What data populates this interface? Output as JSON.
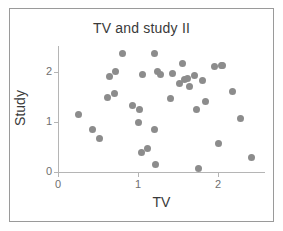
{
  "chart_data": {
    "type": "scatter",
    "title": "TV and study II",
    "xlabel": "TV",
    "ylabel": "Study",
    "xlim": [
      0,
      2.45
    ],
    "ylim": [
      0,
      2.45
    ],
    "grid": false,
    "legend": null,
    "xticks": [
      "0",
      "1",
      "2"
    ],
    "xtick_values": [
      0,
      1,
      2
    ],
    "yticks": [
      "0",
      "1",
      "2"
    ],
    "ytick_values": [
      0,
      1,
      2
    ],
    "marker_color": "#8c8c8c",
    "axis_color": "#b5b5b5",
    "frame_color": "#9a9a9a",
    "text_color": "#3a3a3a",
    "tick_label_color": "#6f6f6f",
    "n_points": 43,
    "x": [
      0.25,
      0.43,
      0.52,
      0.62,
      0.64,
      0.7,
      0.72,
      0.8,
      0.93,
      1.0,
      1.02,
      1.04,
      1.05,
      1.06,
      1.12,
      1.2,
      1.21,
      1.22,
      1.24,
      1.26,
      1.28,
      1.4,
      1.43,
      1.52,
      1.55,
      1.58,
      1.62,
      1.64,
      1.66,
      1.7,
      1.73,
      1.76,
      1.8,
      1.84,
      1.88,
      1.95,
      2.0,
      2.04,
      2.06,
      2.18,
      2.28,
      2.32,
      2.42
    ],
    "y": [
      1.15,
      0.85,
      0.68,
      1.5,
      1.92,
      1.57,
      2.02,
      2.38,
      1.33,
      1.0,
      1.25,
      0.4,
      1.95,
      1.25,
      0.47,
      0.85,
      2.38,
      0.15,
      2.02,
      1.95,
      1.95,
      1.48,
      1.97,
      1.78,
      2.18,
      1.85,
      1.88,
      1.72,
      1.8,
      1.93,
      1.25,
      0.08,
      1.83,
      1.42,
      1.95,
      2.12,
      0.58,
      2.13,
      2.13,
      1.62,
      1.08,
      1.08,
      0.3
    ],
    "points": [
      {
        "x": 0.25,
        "y": 1.15
      },
      {
        "x": 0.43,
        "y": 0.85
      },
      {
        "x": 0.52,
        "y": 0.68
      },
      {
        "x": 0.62,
        "y": 1.5
      },
      {
        "x": 0.64,
        "y": 1.92
      },
      {
        "x": 0.7,
        "y": 1.57
      },
      {
        "x": 0.72,
        "y": 2.02
      },
      {
        "x": 0.8,
        "y": 2.38
      },
      {
        "x": 0.93,
        "y": 1.33
      },
      {
        "x": 1.0,
        "y": 1.0
      },
      {
        "x": 1.02,
        "y": 1.25
      },
      {
        "x": 1.04,
        "y": 0.4
      },
      {
        "x": 1.05,
        "y": 1.95
      },
      {
        "x": 1.12,
        "y": 0.47
      },
      {
        "x": 1.2,
        "y": 0.85
      },
      {
        "x": 1.21,
        "y": 2.38
      },
      {
        "x": 1.22,
        "y": 0.15
      },
      {
        "x": 1.24,
        "y": 2.02
      },
      {
        "x": 1.28,
        "y": 1.95
      },
      {
        "x": 1.4,
        "y": 1.48
      },
      {
        "x": 1.43,
        "y": 1.97
      },
      {
        "x": 1.52,
        "y": 1.78
      },
      {
        "x": 1.55,
        "y": 2.18
      },
      {
        "x": 1.58,
        "y": 1.85
      },
      {
        "x": 1.62,
        "y": 1.88
      },
      {
        "x": 1.64,
        "y": 1.72
      },
      {
        "x": 1.7,
        "y": 1.93
      },
      {
        "x": 1.73,
        "y": 1.25
      },
      {
        "x": 1.76,
        "y": 0.08
      },
      {
        "x": 1.8,
        "y": 1.83
      },
      {
        "x": 1.84,
        "y": 1.42
      },
      {
        "x": 1.95,
        "y": 2.12
      },
      {
        "x": 2.0,
        "y": 0.58
      },
      {
        "x": 2.04,
        "y": 2.13
      },
      {
        "x": 2.06,
        "y": 2.13
      },
      {
        "x": 2.18,
        "y": 1.62
      },
      {
        "x": 2.28,
        "y": 1.08
      },
      {
        "x": 2.42,
        "y": 0.3
      }
    ]
  }
}
